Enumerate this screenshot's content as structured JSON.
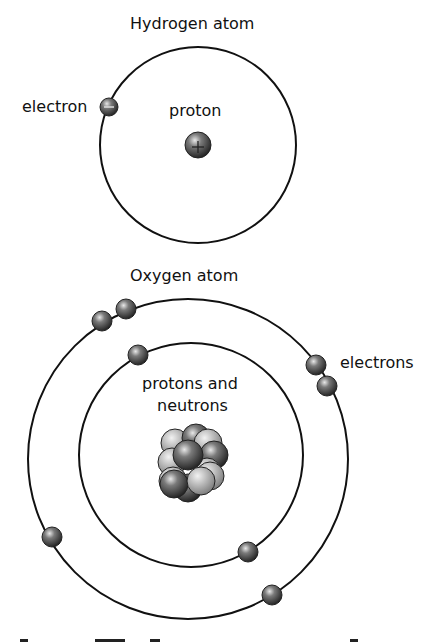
{
  "hydrogen": {
    "title": "Hydrogen atom",
    "electron_label": "electron",
    "proton_label": "proton",
    "electron_sign": "−",
    "proton_sign": "+"
  },
  "oxygen": {
    "title": "Oxygen atom",
    "electrons_label": "electrons",
    "nucleus_label_line1": "protons and",
    "nucleus_label_line2": "neutrons",
    "inner_shell_electrons": 2,
    "outer_shell_electrons": 6
  },
  "colors": {
    "line": "#111111",
    "dark_particle": "#555555",
    "light_particle": "#b8b8b8"
  }
}
